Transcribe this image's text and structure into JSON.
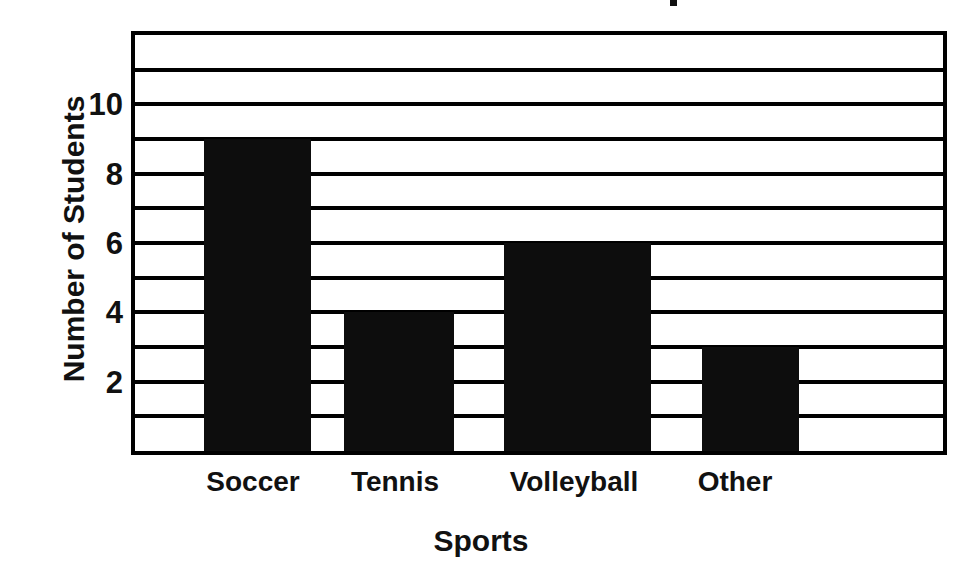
{
  "chart_data": {
    "type": "bar",
    "title": "",
    "title_note": "chart title is cropped off the top edge of the screenshot; only a small ink fragment remains",
    "categories": [
      "Soccer",
      "Tennis",
      "Volleyball",
      "Other"
    ],
    "values": [
      9,
      4,
      6,
      3
    ],
    "series": [
      {
        "name": "Number of Students",
        "values": [
          9,
          4,
          6,
          3
        ]
      }
    ],
    "xlabel": "Sports",
    "ylabel": "Number of Students",
    "ylim": [
      0,
      12
    ],
    "ytick_labels": [
      "2",
      "4",
      "6",
      "8",
      "10"
    ],
    "ytick_values": [
      2,
      4,
      6,
      8,
      10
    ],
    "gridline_values": [
      1,
      2,
      3,
      4,
      5,
      6,
      7,
      8,
      9,
      10,
      11
    ],
    "grid": "horizontal-every-unit",
    "legend": "none",
    "bar_color": "#0d0d0d",
    "axis_color": "#000000",
    "background_color": "#ffffff",
    "bar_geometry": [
      {
        "category": "Soccer",
        "value": 9,
        "left_px": 69,
        "width_px": 107
      },
      {
        "category": "Tennis",
        "value": 4,
        "left_px": 209,
        "width_px": 110
      },
      {
        "category": "Volleyball",
        "value": 6,
        "left_px": 369,
        "width_px": 147
      },
      {
        "category": "Other",
        "value": 3,
        "left_px": 567,
        "width_px": 97
      }
    ],
    "xtick_geometry": [
      {
        "label": "Soccer",
        "center_px": 122
      },
      {
        "label": "Tennis",
        "center_px": 264
      },
      {
        "label": "Volleyball",
        "center_px": 443
      },
      {
        "label": "Other",
        "center_px": 604
      }
    ]
  }
}
